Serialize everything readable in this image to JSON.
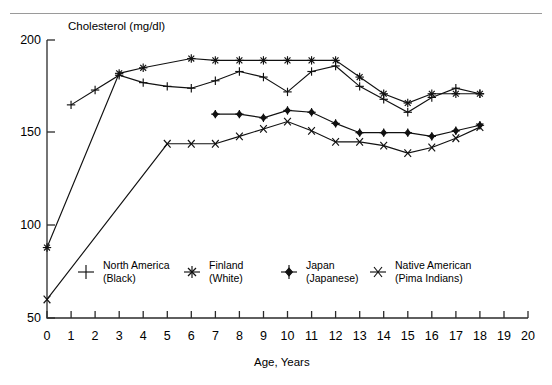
{
  "chart_data": {
    "type": "line",
    "title": "",
    "ylabel": "Cholesterol (mg/dl)",
    "xlabel": "Age, Years",
    "xlim": [
      0,
      20
    ],
    "ylim": [
      50,
      200
    ],
    "yticks": [
      50,
      100,
      150,
      200
    ],
    "xticks": [
      0,
      1,
      2,
      3,
      4,
      5,
      6,
      7,
      8,
      9,
      10,
      11,
      12,
      13,
      14,
      15,
      16,
      17,
      18,
      19,
      20
    ],
    "grid": false,
    "legend_position": "inside-bottom",
    "series": [
      {
        "name": "North America (Black)",
        "label_line1": "North America",
        "label_line2": "(Black)",
        "marker": "plus",
        "x": [
          1,
          2,
          3,
          4,
          5,
          6,
          7,
          8,
          9,
          10,
          11,
          12,
          13,
          14,
          15,
          16,
          17,
          18
        ],
        "values": [
          165,
          173,
          181,
          177,
          175,
          174,
          178,
          183,
          180,
          172,
          183,
          186,
          175,
          168,
          161,
          169,
          174,
          171
        ]
      },
      {
        "name": "Finland (White)",
        "label_line1": "Finland",
        "label_line2": "(White)",
        "marker": "asterisk",
        "x": [
          0,
          3,
          4,
          6,
          7,
          8,
          9,
          10,
          11,
          12,
          13,
          14,
          15,
          16,
          17,
          18
        ],
        "values": [
          88,
          182,
          185,
          190,
          189,
          189,
          189,
          189,
          189,
          189,
          180,
          171,
          166,
          171,
          171,
          171
        ]
      },
      {
        "name": "Japan (Japanese)",
        "label_line1": "Japan",
        "label_line2": "(Japanese)",
        "marker": "diamond",
        "x": [
          7,
          8,
          9,
          10,
          11,
          12,
          13,
          14,
          15,
          16,
          17,
          18
        ],
        "values": [
          160,
          160,
          158,
          162,
          161,
          155,
          150,
          150,
          150,
          148,
          151,
          154
        ]
      },
      {
        "name": "Native American (Pima Indians)",
        "label_line1": "Native American",
        "label_line2": "(Pima Indians)",
        "marker": "cross",
        "x": [
          0,
          5,
          6,
          7,
          8,
          9,
          10,
          11,
          12,
          13,
          14,
          15,
          16,
          17,
          18
        ],
        "values": [
          60,
          144,
          144,
          144,
          148,
          152,
          156,
          151,
          145,
          145,
          143,
          139,
          142,
          147,
          153
        ]
      }
    ]
  },
  "axis": {
    "y_tick_labels": [
      "200",
      "150",
      "100",
      "50"
    ],
    "x_tick_labels": [
      "0",
      "1",
      "2",
      "3",
      "4",
      "5",
      "6",
      "7",
      "8",
      "9",
      "10",
      "11",
      "12",
      "13",
      "14",
      "15",
      "16",
      "17",
      "18",
      "19",
      "20"
    ],
    "y_axis_title": "Cholesterol (mg/dl)",
    "x_axis_title": "Age, Years"
  },
  "legend": {
    "items": [
      {
        "line1": "North America",
        "line2": "(Black)",
        "marker": "plus-marker-icon"
      },
      {
        "line1": "Finland",
        "line2": "(White)",
        "marker": "asterisk-marker-icon"
      },
      {
        "line1": "Japan",
        "line2": "(Japanese)",
        "marker": "diamond-marker-icon"
      },
      {
        "line1": "Native American",
        "line2": "(Pima Indians)",
        "marker": "cross-marker-icon"
      }
    ]
  },
  "colors": {
    "ink": "#111111",
    "axis": "#2b2b2b",
    "rule": "#9a9a9a",
    "background": "#ffffff"
  }
}
